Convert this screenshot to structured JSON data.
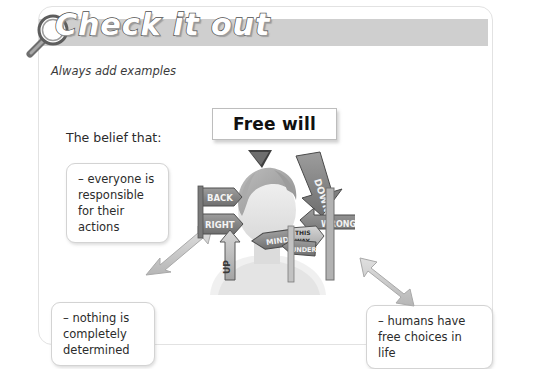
{
  "header": {
    "title": "Check it out",
    "icon": "magnifying-glass-icon",
    "banner_color": "#cfcfcf",
    "title_color": "#ffffff",
    "title_outline_color": "#4d4d4d"
  },
  "subtitle": "Always add examples",
  "belief": {
    "label": "The belief that:"
  },
  "concept": {
    "title": "Free will"
  },
  "notes": [
    {
      "id": "everyone",
      "text": "– everyone is responsible for their actions"
    },
    {
      "id": "nothing",
      "text": "– nothing is completely determined"
    },
    {
      "id": "humans",
      "text": "– humans have free choices in life"
    }
  ],
  "illustration": {
    "name": "person-surrounded-by-direction-signs",
    "signs": [
      {
        "label": "BACK",
        "direction": "right"
      },
      {
        "label": "RIGHT",
        "direction": "right"
      },
      {
        "label": "UP",
        "direction": "up"
      },
      {
        "label": "DOWN",
        "direction": "down"
      },
      {
        "label": "WRONG",
        "direction": "left"
      },
      {
        "label": "MIND",
        "direction": "left"
      },
      {
        "label": "THIS WAY",
        "direction": "right"
      },
      {
        "label": "UNDER",
        "direction": "left"
      }
    ]
  },
  "connectors": [
    {
      "id": "freewill-to-figure",
      "from": "Free will",
      "to": "illustration",
      "style": "solid-dark"
    },
    {
      "id": "figure-to-everyone",
      "from": "illustration",
      "to": "– everyone is responsible for their actions",
      "style": "double-headed-grey"
    },
    {
      "id": "figure-to-humans",
      "from": "illustration",
      "to": "– humans have free choices in life",
      "style": "double-headed-grey"
    }
  ],
  "colors": {
    "panel_border": "#e2e2e2",
    "note_border": "#d3d3d3",
    "arrow_grey": "#cdcdcd",
    "text": "#2b2b2b"
  }
}
